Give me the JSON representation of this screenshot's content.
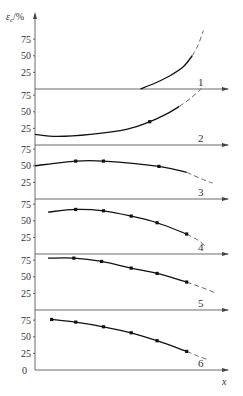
{
  "chart_data": {
    "type": "line",
    "title": "",
    "ylabel": "ε_c/%",
    "xlabel": "x",
    "layout": "six vertically stacked panels sharing one y-axis; each panel has its own baseline x-axis with arrow; panel numbers at right",
    "y_ticks_per_panel": [
      0,
      25,
      50,
      75
    ],
    "x_range": [
      0,
      100
    ],
    "grid": false,
    "legend": "none (panels labeled 1-6 near right end of each x-axis)",
    "panels": [
      {
        "label": "1",
        "ylim": [
          0,
          90
        ],
        "solid": [
          [
            57,
            0
          ],
          [
            65,
            9
          ],
          [
            73,
            20
          ],
          [
            80,
            33
          ],
          [
            85,
            50
          ]
        ],
        "dashed": [
          [
            85,
            50
          ],
          [
            88,
            65
          ],
          [
            90,
            80
          ],
          [
            91,
            88
          ]
        ],
        "markers": []
      },
      {
        "label": "2",
        "ylim": [
          0,
          90
        ],
        "solid": [
          [
            0,
            16
          ],
          [
            12,
            13
          ],
          [
            30,
            16
          ],
          [
            50,
            24
          ],
          [
            62,
            35
          ],
          [
            72,
            48
          ],
          [
            78,
            58
          ]
        ],
        "dashed": [
          [
            78,
            58
          ],
          [
            84,
            70
          ],
          [
            90,
            85
          ]
        ],
        "markers": [
          [
            62,
            35
          ]
        ]
      },
      {
        "label": "3",
        "ylim": [
          0,
          90
        ],
        "solid": [
          [
            0,
            50
          ],
          [
            22,
            57
          ],
          [
            37,
            57
          ],
          [
            67,
            49
          ],
          [
            82,
            40
          ]
        ],
        "dashed": [
          [
            82,
            40
          ],
          [
            92,
            28
          ],
          [
            96,
            24
          ]
        ],
        "markers": [
          [
            22,
            57
          ],
          [
            37,
            57
          ],
          [
            67,
            49
          ]
        ]
      },
      {
        "label": "4",
        "ylim": [
          0,
          90
        ],
        "solid": [
          [
            7,
            63
          ],
          [
            22,
            67
          ],
          [
            37,
            65
          ],
          [
            52,
            57
          ],
          [
            66,
            47
          ],
          [
            82,
            30
          ]
        ],
        "dashed": [
          [
            82,
            30
          ],
          [
            88,
            21
          ],
          [
            92,
            12
          ]
        ],
        "markers": [
          [
            22,
            67
          ],
          [
            37,
            65
          ],
          [
            52,
            57
          ],
          [
            66,
            47
          ],
          [
            82,
            30
          ]
        ]
      },
      {
        "label": "5",
        "ylim": [
          0,
          90
        ],
        "solid": [
          [
            7,
            78
          ],
          [
            21,
            78
          ],
          [
            36,
            73
          ],
          [
            52,
            63
          ],
          [
            66,
            55
          ],
          [
            82,
            42
          ]
        ],
        "dashed": [
          [
            82,
            42
          ],
          [
            92,
            32
          ],
          [
            98,
            25
          ]
        ],
        "markers": [
          [
            21,
            78
          ],
          [
            36,
            73
          ],
          [
            52,
            63
          ],
          [
            66,
            55
          ],
          [
            82,
            42
          ]
        ]
      },
      {
        "label": "6",
        "ylim": [
          0,
          90
        ],
        "solid": [
          [
            9,
            76
          ],
          [
            22,
            72
          ],
          [
            37,
            65
          ],
          [
            52,
            56
          ],
          [
            66,
            44
          ],
          [
            82,
            28
          ]
        ],
        "dashed": [
          [
            82,
            28
          ],
          [
            88,
            21
          ],
          [
            93,
            16
          ]
        ],
        "markers": [
          [
            9,
            76
          ],
          [
            22,
            72
          ],
          [
            37,
            65
          ],
          [
            52,
            56
          ],
          [
            66,
            44
          ],
          [
            82,
            28
          ]
        ]
      }
    ]
  },
  "labels": {
    "y_axis_title": "ε",
    "y_axis_sub": "c",
    "y_axis_unit": "/%",
    "x_axis_title": "x",
    "origin": "0"
  }
}
